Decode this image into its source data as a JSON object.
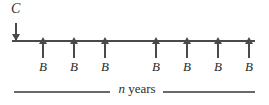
{
  "diagram": {
    "type": "cash-flow-timeline",
    "title": "",
    "axis": {
      "label": "",
      "start_x": 12,
      "end_x": 255,
      "y": 40
    },
    "inflow": {
      "label": "C",
      "direction": "down",
      "position_x": 16,
      "count": 1
    },
    "outflows": [
      {
        "label": "B",
        "direction": "up",
        "position_x": 42
      },
      {
        "label": "B",
        "direction": "up",
        "position_x": 73
      },
      {
        "label": "B",
        "direction": "up",
        "position_x": 104
      },
      {
        "label": "B",
        "direction": "up",
        "position_x": 155
      },
      {
        "label": "B",
        "direction": "up",
        "position_x": 186
      },
      {
        "label": "B",
        "direction": "up",
        "position_x": 217
      },
      {
        "label": "B",
        "direction": "up",
        "position_x": 248
      }
    ],
    "span": {
      "variable": "n",
      "unit": "years",
      "full_text": "n years"
    },
    "colors": {
      "ink": "#2b2b2b",
      "rule": "#4a4a4a",
      "span_rule": "#6a6a6a",
      "background": "#ffffff"
    }
  }
}
